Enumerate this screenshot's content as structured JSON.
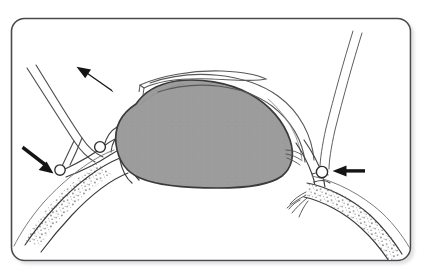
{
  "figure": {
    "kind": "anatomical-line-diagram",
    "title": "Surgical line drawing: grey ovoid mass with flanking vessels, clips and directional arrows",
    "caption": "",
    "background_color": "#ffffff",
    "frame": {
      "name": "rounded-rectangle-border",
      "stroke_color": "#4a4a4d",
      "fill_color": "#ffffff",
      "shadow_color": "#cfcfcf",
      "x": 11,
      "y": 18,
      "width": 400,
      "height": 243,
      "corner_radius": 13,
      "stroke_width": 1.6
    },
    "palette": {
      "ink": "#2b2b2b",
      "ink_light": "#6e6e70",
      "ink_faint": "#9b9b9d",
      "mass_fill": "#9c9c9c",
      "mass_stroke": "#3a3a3a",
      "stipple": "#8e8e90",
      "white": "#ffffff",
      "arrow": "#141414"
    },
    "mass": {
      "name": "grey-ovoid-mass",
      "label": "",
      "fill": "#9c9c9c",
      "stroke": "#3a3a3a",
      "bounds": {
        "left": 108,
        "top": 80,
        "right": 292,
        "bottom": 188
      }
    },
    "white_flap": {
      "name": "white-band-flap",
      "label": "",
      "fill": "#ffffff",
      "stroke": "#5a5a5c"
    },
    "vessels": [
      {
        "name": "vessel-upper-left-tube",
        "label": "",
        "stipple": false,
        "side": "left"
      },
      {
        "name": "vessel-lower-left-stippled",
        "label": "",
        "stipple": true,
        "side": "left"
      },
      {
        "name": "vessel-upper-right-tube",
        "label": "",
        "stipple": false,
        "side": "right"
      },
      {
        "name": "vessel-lower-right-stippled",
        "label": "",
        "stipple": true,
        "side": "right"
      },
      {
        "name": "vessel-arch-over-mass",
        "label": "",
        "stipple": false,
        "side": "top"
      }
    ],
    "clips": [
      {
        "name": "clip-node-left-lower",
        "cx": 60,
        "cy": 170,
        "r": 5.2
      },
      {
        "name": "clip-node-left-upper",
        "cx": 100,
        "cy": 147,
        "r": 5.4
      },
      {
        "name": "clip-node-right",
        "cx": 322,
        "cy": 172,
        "r": 5.6
      }
    ],
    "arrows": [
      {
        "name": "arrow-top-left",
        "label": "",
        "direction": "up-left",
        "from_x": 113,
        "from_y": 92,
        "to_x": 77,
        "to_y": 67
      },
      {
        "name": "arrow-left-middle",
        "label": "",
        "direction": "down-right",
        "from_x": 24,
        "from_y": 147,
        "to_x": 52,
        "to_y": 173
      },
      {
        "name": "arrow-right",
        "label": "",
        "direction": "left",
        "from_x": 364,
        "from_y": 171,
        "to_x": 333,
        "to_y": 171
      }
    ]
  }
}
